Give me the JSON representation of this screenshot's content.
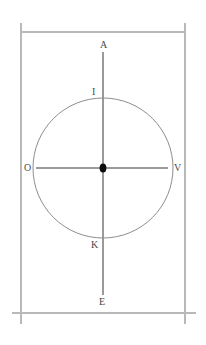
{
  "diagram": {
    "background_color": "#ffffff",
    "frame": {
      "name": "rectangular-border",
      "line_color": "#b9b9b9",
      "left_x": 21,
      "right_x": 185,
      "top_y": 32,
      "bottom_y": 313,
      "vertical_extent": [
        23,
        324
      ],
      "bottom_horizontal_extent": [
        12,
        196
      ]
    },
    "circle": {
      "name": "main-circle",
      "center_x": 103,
      "center_y": 168,
      "radius": 70,
      "stroke_color": "#8d8d8d",
      "fill": "none"
    },
    "vertical_axis": {
      "name": "vertical-axis",
      "x": 103,
      "y_start": 52,
      "y_end": 295,
      "stroke_color": "#9a9a9a"
    },
    "horizontal_axis": {
      "name": "horizontal-axis",
      "y": 168,
      "x_start": 36,
      "x_end": 168,
      "stroke_color": "#9a9a9a"
    },
    "center_point": {
      "name": "center-marker",
      "x": 103,
      "y": 168,
      "color": "#0d0d0d",
      "shape": "diamond"
    },
    "labels": [
      {
        "id": "label-a",
        "text": "A",
        "x": 100,
        "y": 40,
        "position": "top-outer",
        "description": "top end of vertical axis"
      },
      {
        "id": "label-i",
        "text": "I",
        "x": 92,
        "y": 87,
        "position": "top-circle",
        "description": "top of circle on vertical axis"
      },
      {
        "id": "label-o",
        "text": "O",
        "x": 24,
        "y": 163,
        "position": "left-circle",
        "description": "left of circle on horizontal axis"
      },
      {
        "id": "label-v",
        "text": "V",
        "x": 174,
        "y": 163,
        "position": "right-circle",
        "description": "right of circle on horizontal axis"
      },
      {
        "id": "label-k",
        "text": "K",
        "x": 91,
        "y": 240,
        "position": "bottom-circle",
        "description": "bottom of circle on vertical axis"
      },
      {
        "id": "label-e",
        "text": "E",
        "x": 99,
        "y": 297,
        "position": "bottom-outer",
        "description": "bottom end of vertical axis"
      }
    ]
  }
}
